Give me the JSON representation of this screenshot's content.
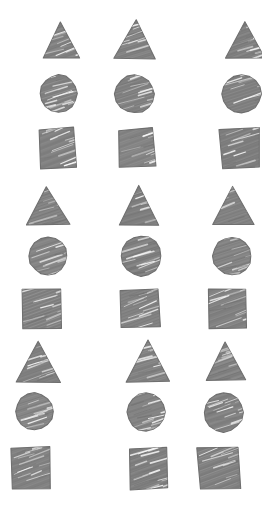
{
  "canvas": {
    "width": 262,
    "height": 513,
    "background": "#ffffff",
    "title": "Hand-sketched shapes grid"
  },
  "style": {
    "fill_color": "#808080",
    "fill_dark": "#6f6f6f",
    "fill_light": "#9a9a9a",
    "streak_color": "#ffffff",
    "texture": "pencil-hatch",
    "stroke_style": "sketchy"
  },
  "grid": {
    "rows": 3,
    "columns": 3,
    "shapes_per_row_group": 3,
    "row_group_order": [
      "triangle",
      "circle",
      "square"
    ],
    "note": "right column clipped at right edge of canvas"
  },
  "shapes": [
    {
      "id": "s1",
      "type": "triangle",
      "label": "triangle",
      "row_group": 1,
      "row": 1,
      "col": 1,
      "x": 41,
      "y": 20,
      "w": 39,
      "h": 39,
      "rot": -1.5
    },
    {
      "id": "s2",
      "type": "triangle",
      "label": "triangle",
      "row_group": 1,
      "row": 1,
      "col": 2,
      "x": 114,
      "y": 19,
      "w": 43,
      "h": 40,
      "rot": 1.0
    },
    {
      "id": "s3",
      "type": "triangle",
      "label": "triangle",
      "row_group": 1,
      "row": 1,
      "col": 3,
      "x": 224,
      "y": 20,
      "w": 42,
      "h": 39,
      "rot": -2.0
    },
    {
      "id": "s4",
      "type": "circle",
      "label": "circle",
      "row_group": 1,
      "row": 2,
      "col": 1,
      "x": 39,
      "y": 74,
      "w": 39,
      "h": 39,
      "rot": 0
    },
    {
      "id": "s5",
      "type": "circle",
      "label": "circle",
      "row_group": 1,
      "row": 2,
      "col": 2,
      "x": 114,
      "y": 74,
      "w": 41,
      "h": 40,
      "rot": 0
    },
    {
      "id": "s6",
      "type": "circle",
      "label": "circle",
      "row_group": 1,
      "row": 2,
      "col": 3,
      "x": 221,
      "y": 74,
      "w": 41,
      "h": 40,
      "rot": 0
    },
    {
      "id": "s7",
      "type": "square",
      "label": "square",
      "row_group": 1,
      "row": 3,
      "col": 1,
      "x": 38,
      "y": 128,
      "w": 38,
      "h": 40,
      "rot": -3.0
    },
    {
      "id": "s8",
      "type": "square",
      "label": "square",
      "row_group": 1,
      "row": 3,
      "col": 2,
      "x": 117,
      "y": 128,
      "w": 38,
      "h": 40,
      "rot": -2.0
    },
    {
      "id": "s9",
      "type": "square",
      "label": "square",
      "row_group": 1,
      "row": 3,
      "col": 3,
      "x": 220,
      "y": 128,
      "w": 40,
      "h": 40,
      "rot": -2.5
    },
    {
      "id": "s10",
      "type": "triangle",
      "label": "triangle",
      "row_group": 2,
      "row": 4,
      "col": 1,
      "x": 25,
      "y": 185,
      "w": 45,
      "h": 41,
      "rot": -1.0
    },
    {
      "id": "s11",
      "type": "triangle",
      "label": "triangle",
      "row_group": 2,
      "row": 4,
      "col": 2,
      "x": 118,
      "y": 185,
      "w": 42,
      "h": 41,
      "rot": 1.5
    },
    {
      "id": "s12",
      "type": "triangle",
      "label": "triangle",
      "row_group": 2,
      "row": 4,
      "col": 3,
      "x": 212,
      "y": 185,
      "w": 43,
      "h": 41,
      "rot": -1.0
    },
    {
      "id": "s13",
      "type": "circle",
      "label": "circle",
      "row_group": 2,
      "row": 5,
      "col": 1,
      "x": 28,
      "y": 236,
      "w": 40,
      "h": 40,
      "rot": 0
    },
    {
      "id": "s14",
      "type": "circle",
      "label": "circle",
      "row_group": 2,
      "row": 5,
      "col": 2,
      "x": 120,
      "y": 235,
      "w": 42,
      "h": 42,
      "rot": 0
    },
    {
      "id": "s15",
      "type": "circle",
      "label": "circle",
      "row_group": 2,
      "row": 5,
      "col": 3,
      "x": 212,
      "y": 236,
      "w": 40,
      "h": 40,
      "rot": 0
    },
    {
      "id": "s16",
      "type": "square",
      "label": "square",
      "row_group": 2,
      "row": 6,
      "col": 1,
      "x": 22,
      "y": 288,
      "w": 40,
      "h": 41,
      "rot": -2.0
    },
    {
      "id": "s17",
      "type": "square",
      "label": "square",
      "row_group": 2,
      "row": 6,
      "col": 2,
      "x": 120,
      "y": 288,
      "w": 40,
      "h": 41,
      "rot": -2.5
    },
    {
      "id": "s18",
      "type": "square",
      "label": "square",
      "row_group": 2,
      "row": 6,
      "col": 3,
      "x": 208,
      "y": 288,
      "w": 40,
      "h": 41,
      "rot": -2.0
    },
    {
      "id": "s19",
      "type": "triangle",
      "label": "triangle",
      "row_group": 3,
      "row": 7,
      "col": 1,
      "x": 15,
      "y": 340,
      "w": 47,
      "h": 43,
      "rot": -1.5
    },
    {
      "id": "s20",
      "type": "triangle",
      "label": "triangle",
      "row_group": 3,
      "row": 7,
      "col": 2,
      "x": 125,
      "y": 340,
      "w": 45,
      "h": 43,
      "rot": 0.5
    },
    {
      "id": "s21",
      "type": "triangle",
      "label": "triangle",
      "row_group": 3,
      "row": 7,
      "col": 3,
      "x": 204,
      "y": 341,
      "w": 42,
      "h": 41,
      "rot": -1.0
    },
    {
      "id": "s22",
      "type": "circle",
      "label": "circle",
      "row_group": 3,
      "row": 8,
      "col": 1,
      "x": 15,
      "y": 392,
      "w": 39,
      "h": 39,
      "rot": 0
    },
    {
      "id": "s23",
      "type": "circle",
      "label": "circle",
      "row_group": 3,
      "row": 8,
      "col": 2,
      "x": 126,
      "y": 392,
      "w": 40,
      "h": 40,
      "rot": 0
    },
    {
      "id": "s24",
      "type": "circle",
      "label": "circle",
      "row_group": 3,
      "row": 8,
      "col": 3,
      "x": 203,
      "y": 392,
      "w": 41,
      "h": 41,
      "rot": 0
    },
    {
      "id": "s25",
      "type": "square",
      "label": "square",
      "row_group": 3,
      "row": 9,
      "col": 1,
      "x": 10,
      "y": 447,
      "w": 41,
      "h": 43,
      "rot": -3.0
    },
    {
      "id": "s26",
      "type": "square",
      "label": "square",
      "row_group": 3,
      "row": 9,
      "col": 2,
      "x": 128,
      "y": 447,
      "w": 40,
      "h": 43,
      "rot": -2.0
    },
    {
      "id": "s27",
      "type": "square",
      "label": "square",
      "row_group": 3,
      "row": 9,
      "col": 3,
      "x": 198,
      "y": 447,
      "w": 42,
      "h": 43,
      "rot": -2.5
    }
  ]
}
